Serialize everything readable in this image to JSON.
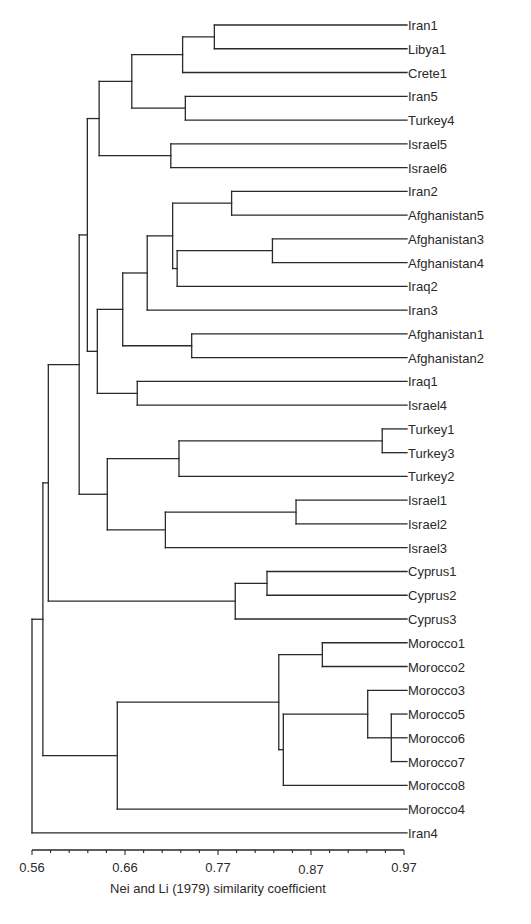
{
  "chart_data": {
    "type": "dendrogram",
    "title": "",
    "xlabel": "Nei and Li (1979) similarity coefficient",
    "ylabel": "",
    "xlim": [
      0.56,
      0.97
    ],
    "x_ticks": [
      0.56,
      0.66,
      0.77,
      0.87,
      0.97
    ],
    "x_tick_labels": [
      "0.56",
      "0.66",
      "0.77",
      "0.87",
      "0.97"
    ],
    "minor_tick_count": 20,
    "grid": false,
    "leaves": [
      "Iran1",
      "Libya1",
      "Crete1",
      "Iran5",
      "Turkey4",
      "Israel5",
      "Israel6",
      "Iran2",
      "Afghanistan5",
      "Afghanistan3",
      "Afghanistan4",
      "Iraq2",
      "Iran3",
      "Afghanistan1",
      "Afghanistan2",
      "Iraq1",
      "Israel4",
      "Turkey1",
      "Turkey3",
      "Turkey2",
      "Israel1",
      "Israel2",
      "Israel3",
      "Cyprus1",
      "Cyprus2",
      "Cyprus3",
      "Morocco1",
      "Morocco2",
      "Morocco3",
      "Morocco5",
      "Morocco6",
      "Morocco7",
      "Morocco8",
      "Morocco4",
      "Iran4"
    ],
    "tree": {
      "v": 0.56,
      "c": [
        {
          "v": 0.572,
          "c": [
            {
              "v": 0.578,
              "c": [
                {
                  "v": 0.612,
                  "c": [
                    {
                      "v": 0.621,
                      "c": [
                        {
                          "v": 0.634,
                          "c": [
                            {
                              "v": 0.67,
                              "c": [
                                {
                                  "v": 0.726,
                                  "c": [
                                    {
                                      "v": 0.761,
                                      "c": [
                                        {
                                          "leaf": 0
                                        },
                                        {
                                          "leaf": 1
                                        }
                                      ]
                                    },
                                    {
                                      "leaf": 2
                                    }
                                  ]
                                },
                                {
                                  "v": 0.729,
                                  "c": [
                                    {
                                      "leaf": 3
                                    },
                                    {
                                      "leaf": 4
                                    }
                                  ]
                                }
                              ]
                            },
                            {
                              "v": 0.713,
                              "c": [
                                {
                                  "leaf": 5
                                },
                                {
                                  "leaf": 6
                                }
                              ]
                            }
                          ]
                        },
                        {
                          "v": 0.632,
                          "c": [
                            {
                              "v": 0.66,
                              "c": [
                                {
                                  "v": 0.687,
                                  "c": [
                                    {
                                      "v": 0.715,
                                      "c": [
                                        {
                                          "v": 0.78,
                                          "c": [
                                            {
                                              "leaf": 7
                                            },
                                            {
                                              "leaf": 8
                                            }
                                          ]
                                        },
                                        {
                                          "v": 0.72,
                                          "c": [
                                            {
                                              "v": 0.825,
                                              "c": [
                                                {
                                                  "leaf": 9
                                                },
                                                {
                                                  "leaf": 10
                                                }
                                              ]
                                            },
                                            {
                                              "leaf": 11
                                            }
                                          ]
                                        }
                                      ]
                                    },
                                    {
                                      "leaf": 12
                                    }
                                  ]
                                },
                                {
                                  "v": 0.736,
                                  "c": [
                                    {
                                      "leaf": 13
                                    },
                                    {
                                      "leaf": 14
                                    }
                                  ]
                                }
                              ]
                            },
                            {
                              "v": 0.676,
                              "c": [
                                {
                                  "leaf": 15
                                },
                                {
                                  "leaf": 16
                                }
                              ]
                            }
                          ]
                        }
                      ]
                    },
                    {
                      "v": 0.643,
                      "c": [
                        {
                          "v": 0.722,
                          "c": [
                            {
                              "v": 0.946,
                              "c": [
                                {
                                  "leaf": 17
                                },
                                {
                                  "leaf": 18
                                }
                              ]
                            },
                            {
                              "leaf": 19
                            }
                          ]
                        },
                        {
                          "v": 0.707,
                          "c": [
                            {
                              "v": 0.851,
                              "c": [
                                {
                                  "leaf": 20
                                },
                                {
                                  "leaf": 21
                                }
                              ]
                            },
                            {
                              "leaf": 22
                            }
                          ]
                        }
                      ]
                    }
                  ]
                },
                {
                  "v": 0.784,
                  "c": [
                    {
                      "v": 0.819,
                      "c": [
                        {
                          "leaf": 23
                        },
                        {
                          "leaf": 24
                        }
                      ]
                    },
                    {
                      "leaf": 25
                    }
                  ]
                }
              ]
            },
            {
              "v": 0.654,
              "c": [
                {
                  "v": 0.832,
                  "c": [
                    {
                      "v": 0.88,
                      "c": [
                        {
                          "leaf": 26
                        },
                        {
                          "leaf": 27
                        }
                      ]
                    },
                    {
                      "v": 0.837,
                      "c": [
                        {
                          "v": 0.93,
                          "c": [
                            {
                              "leaf": 28
                            },
                            {
                              "v": 0.956,
                              "c": [
                                {
                                  "leaf": 29
                                },
                                {
                                  "leaf": 30
                                },
                                {
                                  "leaf": 31
                                }
                              ]
                            }
                          ]
                        },
                        {
                          "leaf": 32
                        }
                      ]
                    }
                  ]
                },
                {
                  "leaf": 33
                }
              ]
            }
          ]
        },
        {
          "leaf": 34
        }
      ]
    }
  },
  "layout": {
    "x_left_px": 32,
    "x_right_px": 404,
    "leaf_end_px": 407,
    "label_x_px": 408,
    "first_leaf_y_px": 25,
    "leaf_spacing_px": 23.76,
    "axis_y_px": 850
  }
}
